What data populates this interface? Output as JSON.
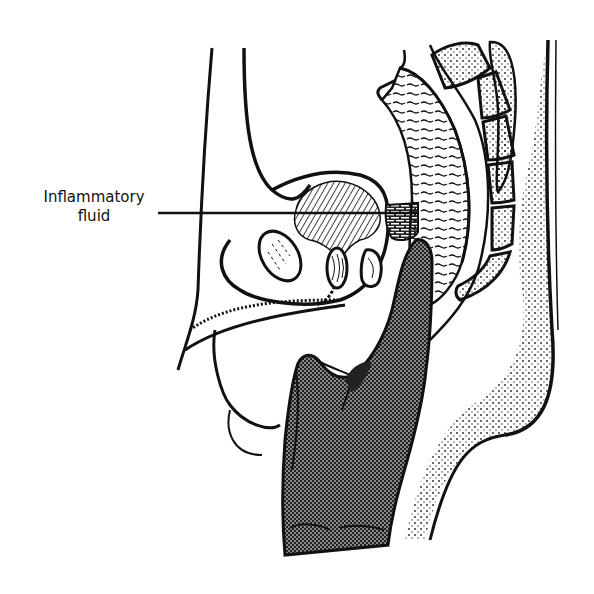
{
  "figure": {
    "type": "anatomical line illustration",
    "background_color": "#ffffff",
    "ink_color": "#111111",
    "glove_fill": "#6a6a6a",
    "fluid_fill": "#3a3a3a"
  },
  "labels": [
    {
      "id": "inflammatory-fluid",
      "line1": "Inflammatory",
      "line2": "fluid",
      "pointer_target": "rectovesical pouch fluid collection"
    }
  ]
}
